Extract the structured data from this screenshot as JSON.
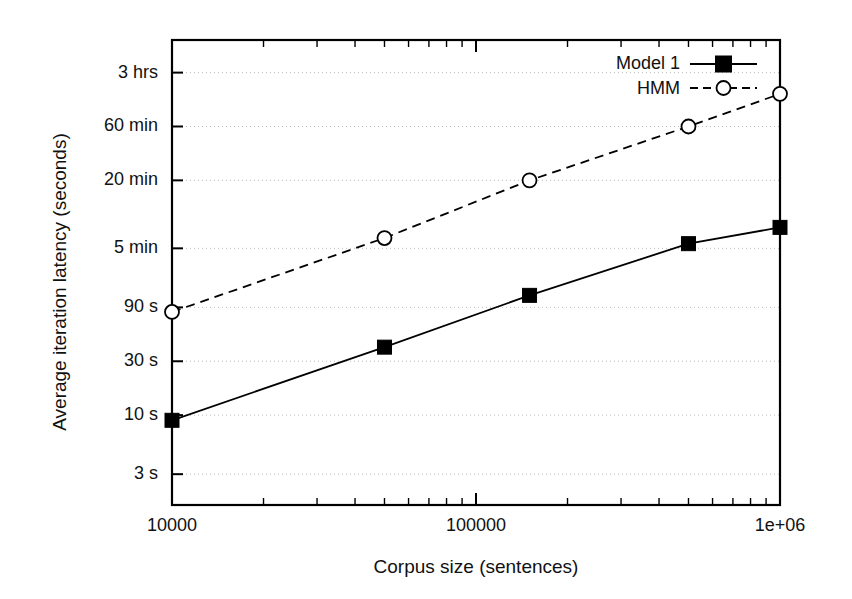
{
  "chart_data": {
    "type": "line",
    "title": "",
    "xlabel": "Corpus size (sentences)",
    "ylabel": "Average iteration latency (seconds)",
    "xscale": "log",
    "yscale": "log",
    "xlim": [
      10000,
      1000000
    ],
    "ylim": [
      1.6,
      21000
    ],
    "grid": true,
    "grid_style": "dotted horizontal gridlines only",
    "legend_position": "top right (inside axes)",
    "x_tick_labels": [
      "10000",
      "100000",
      "1e+06"
    ],
    "x_tick_values": [
      10000,
      100000,
      1000000
    ],
    "y_tick_labels": [
      "3 hrs",
      "60 min",
      "20 min",
      "5 min",
      "90 s",
      "30 s",
      "10 s",
      "3 s"
    ],
    "y_tick_values": [
      10800,
      3600,
      1200,
      300,
      90,
      30,
      10,
      3
    ],
    "x": [
      10000,
      50000,
      150000,
      500000,
      1000000
    ],
    "series": [
      {
        "name": "Model 1",
        "marker": "filled-square",
        "linestyle": "solid",
        "color": "#000000",
        "values": [
          9,
          40,
          115,
          330,
          460
        ],
        "value_labels": [
          "9 s",
          "40 s",
          "115 s",
          "330 s",
          "460 s"
        ]
      },
      {
        "name": "HMM",
        "marker": "open-circle",
        "linestyle": "dashed",
        "color": "#000000",
        "values": [
          82,
          370,
          1200,
          3600,
          7000
        ],
        "value_labels": [
          "82 s",
          "370 s",
          "20 min",
          "60 min",
          "7000 s"
        ]
      }
    ]
  },
  "legend": {
    "entries": [
      {
        "label": "Model 1"
      },
      {
        "label": "HMM"
      }
    ]
  },
  "colors": {
    "ink": "#000000",
    "grid": "#bbbbbb",
    "background": "#ffffff"
  }
}
